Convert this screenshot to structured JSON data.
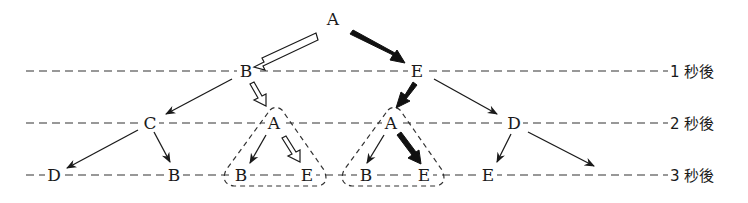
{
  "diagram": {
    "type": "state-transition-tree",
    "time_levels": [
      {
        "label": "1 秒後",
        "y": 70
      },
      {
        "label": "2 秒後",
        "y": 123
      },
      {
        "label": "3 秒後",
        "y": 175
      }
    ],
    "nodes": {
      "root": {
        "label": "A"
      },
      "l1_b": {
        "label": "B"
      },
      "l1_e": {
        "label": "E"
      },
      "l2_c": {
        "label": "C"
      },
      "l2_a1": {
        "label": "A"
      },
      "l2_a2": {
        "label": "A"
      },
      "l2_d": {
        "label": "D"
      },
      "l3_d": {
        "label": "D"
      },
      "l3_b1": {
        "label": "B"
      },
      "l3_b2": {
        "label": "B"
      },
      "l3_e1": {
        "label": "E"
      },
      "l3_b3": {
        "label": "B"
      },
      "l3_e2": {
        "label": "E"
      },
      "l3_e3": {
        "label": "E"
      }
    },
    "edges": [
      {
        "from": "A",
        "to": "B",
        "style": "hollow-arrow"
      },
      {
        "from": "A",
        "to": "E",
        "style": "bold-arrow"
      },
      {
        "from": "B",
        "to": "C",
        "style": "thin-arrow"
      },
      {
        "from": "B",
        "to": "A",
        "style": "hollow-arrow"
      },
      {
        "from": "E",
        "to": "A",
        "style": "bold-arrow"
      },
      {
        "from": "E",
        "to": "D",
        "style": "thin-arrow"
      },
      {
        "from": "C",
        "to": "D",
        "style": "thin-arrow"
      },
      {
        "from": "C",
        "to": "B",
        "style": "thin-arrow"
      },
      {
        "from": "A",
        "to": "B",
        "style": "thin-arrow"
      },
      {
        "from": "A",
        "to": "E",
        "style": "hollow-arrow"
      },
      {
        "from": "A",
        "to": "B",
        "style": "thin-arrow"
      },
      {
        "from": "A",
        "to": "E",
        "style": "bold-arrow"
      },
      {
        "from": "D",
        "to": "E",
        "style": "thin-arrow"
      },
      {
        "from": "D",
        "to": "(off)",
        "style": "thin-arrow"
      }
    ],
    "groups": [
      "dashed-triangle-left",
      "dashed-triangle-right"
    ]
  }
}
